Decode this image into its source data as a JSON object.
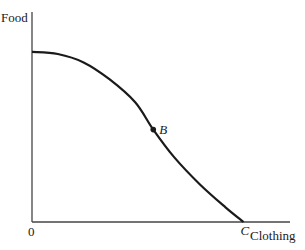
{
  "chart_data": {
    "type": "line",
    "title": "",
    "xlabel": "Clothing",
    "ylabel": "Food",
    "origin_label": "0",
    "curve": {
      "name": "production-possibilities-frontier",
      "description": "Concave curve from the Food intercept down to point C on the Clothing axis",
      "points": [
        [
          0,
          0.81
        ],
        [
          0.1,
          0.8
        ],
        [
          0.2,
          0.76
        ],
        [
          0.3,
          0.68
        ],
        [
          0.4,
          0.57
        ],
        [
          0.47,
          0.44
        ],
        [
          0.55,
          0.31
        ],
        [
          0.65,
          0.18
        ],
        [
          0.75,
          0.07
        ],
        [
          0.82,
          0.0
        ]
      ]
    },
    "points": [
      {
        "label": "B",
        "x": 0.47,
        "y": 0.44,
        "marker": true
      },
      {
        "label": "C",
        "x": 0.82,
        "y": 0.0,
        "marker": false
      }
    ],
    "xlim": [
      0,
      1
    ],
    "ylim": [
      0,
      1
    ],
    "grid": false,
    "legend": "none",
    "colors": {
      "line": "#1a1a1a",
      "axis": "#444444"
    }
  }
}
